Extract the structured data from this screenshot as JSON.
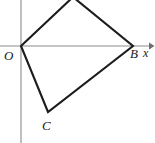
{
  "figure": {
    "background_color": "#ffffff",
    "stroke_color": "#1c1c1c",
    "axis_color": "#8b8b8b",
    "labels": {
      "origin": "O",
      "vertex_b": "B",
      "vertex_c": "C",
      "x_axis": "x"
    },
    "axes": {
      "x_axis": {
        "label": "x",
        "y_pixel": 46,
        "x_start": 0,
        "x_end": 152,
        "has_arrow": true
      },
      "y_axis": {
        "label": "",
        "x_pixel": 21,
        "y_start": 0,
        "y_end": 143,
        "has_arrow": false
      }
    },
    "vertices": [
      {
        "name": "O",
        "x": 21,
        "y": 46,
        "labeled": true,
        "label_text": "O"
      },
      {
        "name": "A",
        "x": 73,
        "y": -3,
        "labeled": false,
        "label_text": ""
      },
      {
        "name": "B",
        "x": 133,
        "y": 46,
        "labeled": true,
        "label_text": "B"
      },
      {
        "name": "C",
        "x": 48,
        "y": 112,
        "labeled": true,
        "label_text": "C"
      }
    ],
    "edges": [
      {
        "name": "edge-O-A",
        "from": "O",
        "to": "A"
      },
      {
        "name": "edge-A-B",
        "from": "A",
        "to": "B"
      },
      {
        "name": "edge-B-C",
        "from": "B",
        "to": "C"
      },
      {
        "name": "edge-C-O",
        "from": "C",
        "to": "O"
      }
    ],
    "path": "M 21 46 L 73 -3 L 133 46 L 48 112 Z"
  }
}
